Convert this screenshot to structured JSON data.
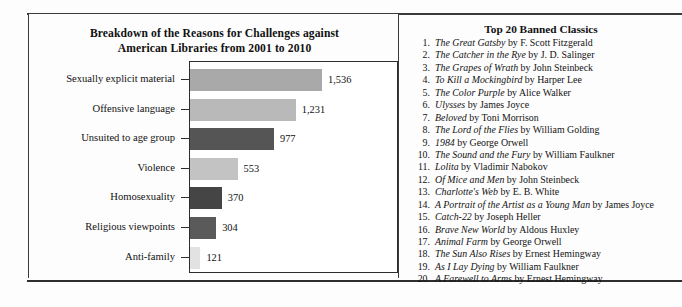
{
  "chart_panel": {
    "title_line1": "Breakdown of the Reasons for Challenges against",
    "title_line2": "American Libraries from 2001 to 2010"
  },
  "chart_data": {
    "type": "bar",
    "orientation": "horizontal",
    "title": "Breakdown of the Reasons for Challenges against American Libraries from 2001 to 2010",
    "xlabel": "",
    "ylabel": "",
    "xlim": [
      0,
      1536
    ],
    "grid": false,
    "legend": false,
    "categories": [
      "Sexually explicit material",
      "Offensive language",
      "Unsuited to age group",
      "Violence",
      "Homosexuality",
      "Religious viewpoints",
      "Anti-family"
    ],
    "values": [
      1536,
      1231,
      977,
      553,
      370,
      304,
      121
    ],
    "value_labels": [
      "1,536",
      "1,231",
      "977",
      "553",
      "370",
      "304",
      "121"
    ],
    "bar_colors": [
      "#a9a9a9",
      "#b9b9b9",
      "#555555",
      "#c3c3c3",
      "#454545",
      "#5a5a5a",
      "#e2e2e2"
    ]
  },
  "list_panel": {
    "heading": "Top 20 Banned Classics",
    "books": [
      {
        "num": "1.",
        "title": "The Great Gatsby",
        "by": " by F. Scott Fitzgerald"
      },
      {
        "num": "2.",
        "title": "The Catcher in the Rye",
        "by": " by J. D. Salinger"
      },
      {
        "num": "3.",
        "title": "The Grapes of Wrath",
        "by": " by John Steinbeck"
      },
      {
        "num": "4.",
        "title": "To Kill a Mockingbird",
        "by": " by Harper Lee"
      },
      {
        "num": "5.",
        "title": "The Color Purple",
        "by": " by Alice Walker"
      },
      {
        "num": "6.",
        "title": "Ulysses",
        "by": " by James Joyce"
      },
      {
        "num": "7.",
        "title": "Beloved",
        "by": " by Toni Morrison"
      },
      {
        "num": "8.",
        "title": "The Lord of the Flies",
        "by": " by William Golding"
      },
      {
        "num": "9.",
        "title": "1984",
        "by": " by George Orwell"
      },
      {
        "num": "10.",
        "title": "The Sound and the Fury",
        "by": " by William Faulkner"
      },
      {
        "num": "11.",
        "title": "Lolita",
        "by": " by Vladimir Nabokov"
      },
      {
        "num": "12.",
        "title": "Of Mice and Men",
        "by": " by John Steinbeck"
      },
      {
        "num": "13.",
        "title": "Charlotte's Web",
        "by": " by E. B. White"
      },
      {
        "num": "14.",
        "title": "A Portrait of the Artist as a Young Man",
        "by": " by James Joyce"
      },
      {
        "num": "15.",
        "title": "Catch-22",
        "by": " by Joseph Heller"
      },
      {
        "num": "16.",
        "title": "Brave New World",
        "by": " by Aldous Huxley"
      },
      {
        "num": "17.",
        "title": "Animal Farm",
        "by": " by George Orwell"
      },
      {
        "num": "18.",
        "title": "The Sun Also Rises",
        "by": " by Ernest Hemingway"
      },
      {
        "num": "19.",
        "title": "As I Lay Dying",
        "by": " by William Faulkner"
      },
      {
        "num": "20.",
        "title": "A Farewell to Arms",
        "by": " by Ernest Hemingway"
      }
    ]
  }
}
